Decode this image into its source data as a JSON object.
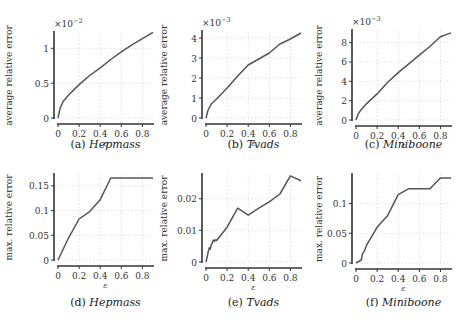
{
  "chart_data": [
    {
      "id": "a",
      "type": "line",
      "caption_label": "(a)",
      "caption_name": "Hepmass",
      "xlabel": "ε",
      "ylabel": "average relative error",
      "multiplier": "×10",
      "exponent": "−2",
      "x_ticks": [
        0,
        0.2,
        0.4,
        0.6,
        0.8
      ],
      "y_ticks": [
        0,
        0.5,
        1
      ],
      "y_tick_labels": [
        "0",
        "0.5",
        "1"
      ],
      "xlim": [
        0,
        0.9
      ],
      "ylim": [
        0,
        1.22
      ],
      "x": [
        0,
        0.02,
        0.05,
        0.1,
        0.2,
        0.3,
        0.4,
        0.5,
        0.6,
        0.7,
        0.8,
        0.9
      ],
      "y": [
        0,
        0.14,
        0.24,
        0.33,
        0.48,
        0.61,
        0.72,
        0.84,
        0.95,
        1.05,
        1.14,
        1.23
      ]
    },
    {
      "id": "b",
      "type": "line",
      "caption_label": "(b)",
      "caption_name": "Tvads",
      "xlabel": "ε",
      "ylabel": "average relative error",
      "multiplier": "×10",
      "exponent": "−3",
      "x_ticks": [
        0,
        0.2,
        0.4,
        0.6,
        0.8
      ],
      "y_ticks": [
        0,
        1,
        2,
        3,
        4
      ],
      "y_tick_labels": [
        "0",
        "1",
        "2",
        "3",
        "4"
      ],
      "xlim": [
        0,
        0.9
      ],
      "ylim": [
        0,
        4.3
      ],
      "x": [
        0,
        0.02,
        0.05,
        0.08,
        0.1,
        0.2,
        0.3,
        0.4,
        0.5,
        0.6,
        0.7,
        0.8,
        0.9
      ],
      "y": [
        0,
        0.4,
        0.7,
        0.85,
        0.95,
        1.5,
        2.1,
        2.65,
        2.95,
        3.25,
        3.7,
        3.95,
        4.25
      ]
    },
    {
      "id": "c",
      "type": "line",
      "caption_label": "(c)",
      "caption_name": "Miniboone",
      "xlabel": "ε",
      "ylabel": "average relative error",
      "multiplier": "×10",
      "exponent": "−3",
      "x_ticks": [
        0,
        0.2,
        0.4,
        0.6,
        0.8
      ],
      "y_ticks": [
        0,
        2,
        4,
        6,
        8
      ],
      "y_tick_labels": [
        "0",
        "2",
        "4",
        "6",
        "8"
      ],
      "xlim": [
        0,
        0.9
      ],
      "ylim": [
        0,
        9.2
      ],
      "x": [
        0,
        0.02,
        0.05,
        0.1,
        0.2,
        0.3,
        0.4,
        0.5,
        0.6,
        0.7,
        0.8,
        0.9
      ],
      "y": [
        0,
        0.6,
        1.1,
        1.7,
        2.7,
        3.9,
        4.9,
        5.8,
        6.7,
        7.6,
        8.6,
        9.0
      ]
    },
    {
      "id": "d",
      "type": "line",
      "caption_label": "(d)",
      "caption_name": "Hepmass",
      "xlabel": "ε",
      "ylabel": "max. relative error",
      "multiplier": "",
      "exponent": "",
      "x_ticks": [
        0,
        0.2,
        0.4,
        0.6,
        0.8
      ],
      "y_ticks": [
        0,
        0.05,
        0.1,
        0.15
      ],
      "y_tick_labels": [
        "0",
        "0.05",
        "0.1",
        "0.15"
      ],
      "xlim": [
        0,
        0.9
      ],
      "ylim": [
        0,
        0.172
      ],
      "x": [
        0,
        0.1,
        0.2,
        0.3,
        0.4,
        0.5,
        0.6,
        0.7,
        0.8,
        0.9
      ],
      "y": [
        0,
        0.045,
        0.083,
        0.098,
        0.122,
        0.166,
        0.166,
        0.166,
        0.166,
        0.166
      ]
    },
    {
      "id": "e",
      "type": "line",
      "caption_label": "(e)",
      "caption_name": "Tvads",
      "xlabel": "ε",
      "ylabel": "max. relative error",
      "multiplier": "",
      "exponent": "",
      "x_ticks": [
        0,
        0.2,
        0.4,
        0.6,
        0.8
      ],
      "y_ticks": [
        0,
        0.01,
        0.02
      ],
      "y_tick_labels": [
        "0",
        "0.01",
        "0.02"
      ],
      "xlim": [
        0,
        0.9
      ],
      "ylim": [
        0,
        0.0275
      ],
      "x": [
        0,
        0.02,
        0.03,
        0.04,
        0.05,
        0.06,
        0.07,
        0.08,
        0.09,
        0.1,
        0.2,
        0.3,
        0.4,
        0.5,
        0.6,
        0.7,
        0.8,
        0.9
      ],
      "y": [
        0,
        0.003,
        0.0045,
        0.004,
        0.0055,
        0.006,
        0.007,
        0.0065,
        0.007,
        0.0068,
        0.011,
        0.017,
        0.0148,
        0.017,
        0.019,
        0.0215,
        0.0272,
        0.0257
      ]
    },
    {
      "id": "f",
      "type": "line",
      "caption_label": "(f)",
      "caption_name": "Miniboone",
      "xlabel": "ε",
      "ylabel": "max. relative error",
      "multiplier": "",
      "exponent": "",
      "x_ticks": [
        0,
        0.2,
        0.4,
        0.6,
        0.8
      ],
      "y_ticks": [
        0,
        0.05,
        0.1
      ],
      "y_tick_labels": [
        "0",
        "0.05",
        "0.1"
      ],
      "xlim": [
        0,
        0.9
      ],
      "ylim": [
        0,
        0.148
      ],
      "x": [
        0,
        0.05,
        0.06,
        0.08,
        0.1,
        0.2,
        0.3,
        0.4,
        0.5,
        0.6,
        0.7,
        0.8,
        0.9
      ],
      "y": [
        0,
        0.005,
        0.015,
        0.02,
        0.03,
        0.06,
        0.08,
        0.115,
        0.125,
        0.125,
        0.125,
        0.143,
        0.143
      ]
    }
  ]
}
